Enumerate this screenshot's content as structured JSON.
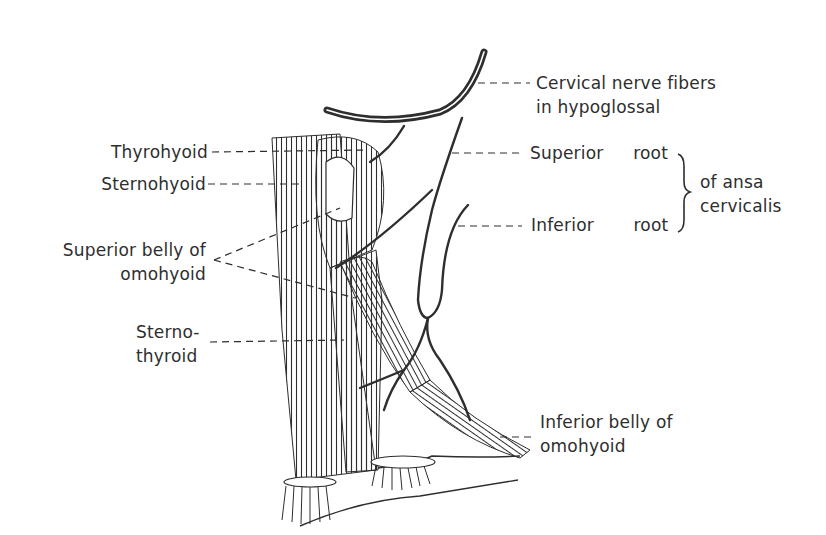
{
  "figure": {
    "labels": {
      "cervical_nerve_fibers_line1": "Cervical nerve fibers",
      "cervical_nerve_fibers_line2": "in hypoglossal",
      "superior_root_a": "Superior",
      "superior_root_b": "root",
      "inferior_root_a": "Inferior",
      "inferior_root_b": "root",
      "ansa_line1": "of ansa",
      "ansa_line2": "cervicalis",
      "thyrohyoid": "Thyrohyoid",
      "sternohyoid": "Sternohyoid",
      "superior_belly_line1": "Superior belly of",
      "superior_belly_line2": "omohyoid",
      "sternothyroid_line1": "Sterno-",
      "sternothyroid_line2": "thyroid",
      "inferior_belly_line1": "Inferior belly of",
      "inferior_belly_line2": "omohyoid"
    },
    "colors": {
      "ink": "#2e2e2e",
      "background": "#ffffff"
    }
  }
}
